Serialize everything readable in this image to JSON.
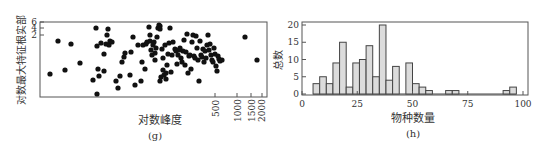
{
  "chart_data": [
    {
      "type": "scatter",
      "panel_label": "(g)",
      "xlabel": "对数峰度",
      "ylabel": "对数最大特征根实部",
      "x_scale": "log",
      "x_ticks": [
        "500",
        "1000",
        "1500",
        "2000"
      ],
      "y_ticks": [
        "6",
        "4",
        "2"
      ],
      "grid": false,
      "points_px": [
        [
          50,
          74
        ],
        [
          58,
          41
        ],
        [
          65,
          70
        ],
        [
          71,
          44
        ],
        [
          80,
          63
        ],
        [
          93,
          80
        ],
        [
          96,
          28
        ],
        [
          97,
          94
        ],
        [
          97,
          46
        ],
        [
          98,
          69
        ],
        [
          99,
          76
        ],
        [
          101,
          43
        ],
        [
          104,
          54
        ],
        [
          104,
          71
        ],
        [
          106,
          44
        ],
        [
          107,
          35
        ],
        [
          108,
          29
        ],
        [
          109,
          45
        ],
        [
          110,
          41
        ],
        [
          112,
          42
        ],
        [
          116,
          81
        ],
        [
          118,
          88
        ],
        [
          120,
          76
        ],
        [
          122,
          62
        ],
        [
          124,
          57
        ],
        [
          125,
          53
        ],
        [
          130,
          75
        ],
        [
          131,
          52
        ],
        [
          133,
          37
        ],
        [
          135,
          85
        ],
        [
          138,
          45
        ],
        [
          141,
          81
        ],
        [
          142,
          62
        ],
        [
          143,
          45
        ],
        [
          145,
          69
        ],
        [
          146,
          44
        ],
        [
          147,
          42
        ],
        [
          149,
          27
        ],
        [
          150,
          41
        ],
        [
          150,
          35
        ],
        [
          151,
          50
        ],
        [
          152,
          55
        ],
        [
          153,
          45
        ],
        [
          154,
          42
        ],
        [
          155,
          60
        ],
        [
          155,
          53
        ],
        [
          156,
          48
        ],
        [
          157,
          37
        ],
        [
          158,
          28
        ],
        [
          159,
          25
        ],
        [
          160,
          26
        ],
        [
          160,
          29
        ],
        [
          160,
          81
        ],
        [
          161,
          77
        ],
        [
          162,
          49
        ],
        [
          163,
          58
        ],
        [
          163,
          70
        ],
        [
          164,
          75
        ],
        [
          165,
          45
        ],
        [
          166,
          79
        ],
        [
          166,
          73
        ],
        [
          167,
          65
        ],
        [
          168,
          54
        ],
        [
          169,
          43
        ],
        [
          170,
          28
        ],
        [
          171,
          72
        ],
        [
          172,
          55
        ],
        [
          173,
          42
        ],
        [
          175,
          49
        ],
        [
          176,
          51
        ],
        [
          177,
          64
        ],
        [
          178,
          55
        ],
        [
          179,
          50
        ],
        [
          180,
          48
        ],
        [
          181,
          58
        ],
        [
          182,
          62
        ],
        [
          183,
          51
        ],
        [
          184,
          40
        ],
        [
          185,
          65
        ],
        [
          186,
          52
        ],
        [
          187,
          34
        ],
        [
          188,
          73
        ],
        [
          189,
          56
        ],
        [
          190,
          55
        ],
        [
          191,
          69
        ],
        [
          192,
          42
        ],
        [
          193,
          35
        ],
        [
          194,
          56
        ],
        [
          195,
          58
        ],
        [
          196,
          36
        ],
        [
          197,
          48
        ],
        [
          198,
          60
        ],
        [
          199,
          81
        ],
        [
          200,
          41
        ],
        [
          201,
          55
        ],
        [
          202,
          57
        ],
        [
          203,
          49
        ],
        [
          204,
          62
        ],
        [
          205,
          51
        ],
        [
          206,
          58
        ],
        [
          207,
          45
        ],
        [
          208,
          35
        ],
        [
          209,
          50
        ],
        [
          210,
          44
        ],
        [
          211,
          55
        ],
        [
          212,
          60
        ],
        [
          213,
          62
        ],
        [
          214,
          48
        ],
        [
          215,
          54
        ],
        [
          216,
          66
        ],
        [
          217,
          71
        ],
        [
          218,
          56
        ],
        [
          219,
          59
        ],
        [
          220,
          61
        ],
        [
          222,
          60
        ],
        [
          245,
          37
        ],
        [
          257,
          60
        ]
      ]
    },
    {
      "type": "bar",
      "panel_label": "(h)",
      "title": "",
      "xlabel": "物种数量",
      "ylabel": "总数",
      "xlim": [
        0,
        100
      ],
      "ylim": [
        0,
        20
      ],
      "x_ticks": [
        "0",
        "25",
        "50",
        "75",
        "100"
      ],
      "y_ticks": [
        "0",
        "5",
        "10",
        "15",
        "20"
      ],
      "grid": false,
      "bins": [
        {
          "start": 5,
          "end": 8,
          "value": 3
        },
        {
          "start": 8,
          "end": 11,
          "value": 5
        },
        {
          "start": 11,
          "end": 14,
          "value": 3
        },
        {
          "start": 14,
          "end": 17,
          "value": 9
        },
        {
          "start": 17,
          "end": 20,
          "value": 15
        },
        {
          "start": 20,
          "end": 23,
          "value": 2
        },
        {
          "start": 23,
          "end": 26,
          "value": 9
        },
        {
          "start": 26,
          "end": 29,
          "value": 10
        },
        {
          "start": 29,
          "end": 32,
          "value": 14
        },
        {
          "start": 32,
          "end": 35,
          "value": 5
        },
        {
          "start": 35,
          "end": 38,
          "value": 20
        },
        {
          "start": 38,
          "end": 41,
          "value": 4
        },
        {
          "start": 41,
          "end": 44,
          "value": 8
        },
        {
          "start": 44,
          "end": 47,
          "value": 0
        },
        {
          "start": 47,
          "end": 50,
          "value": 9
        },
        {
          "start": 50,
          "end": 53,
          "value": 3
        },
        {
          "start": 53,
          "end": 56,
          "value": 2
        },
        {
          "start": 56,
          "end": 59,
          "value": 1
        },
        {
          "start": 65,
          "end": 68,
          "value": 1
        },
        {
          "start": 68,
          "end": 71,
          "value": 1
        },
        {
          "start": 91,
          "end": 94,
          "value": 1
        },
        {
          "start": 94,
          "end": 97,
          "value": 2
        }
      ],
      "bar_fill": "#dcdcdc",
      "bar_edge": "#444444"
    }
  ],
  "labels": {
    "g": {
      "xlabel": "对数峰度",
      "ylabel": "对数最大特征根实部",
      "panel": "(g)",
      "yticks": [
        "6",
        "4",
        "2"
      ],
      "xticks": [
        "500",
        "1000",
        "1500",
        "2000"
      ]
    },
    "h": {
      "xlabel": "物种数量",
      "ylabel": "总数",
      "panel": "(h)",
      "yticks": [
        "20",
        "15",
        "10",
        "5",
        "0"
      ],
      "xticks": [
        "0",
        "25",
        "50",
        "75",
        "100"
      ]
    }
  }
}
